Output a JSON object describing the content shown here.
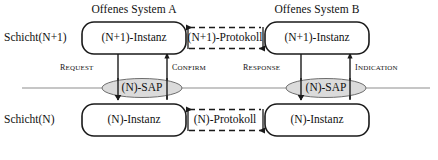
{
  "diagram": {
    "systems": [
      {
        "id": "system-a",
        "title": "Offenes System A"
      },
      {
        "id": "system-b",
        "title": "Offenes System B"
      }
    ],
    "layers": [
      {
        "id": "layer-n-plus-1",
        "label": "Schicht(N+1)"
      },
      {
        "id": "layer-n",
        "label": "Schicht(N)"
      }
    ],
    "entities": [
      {
        "id": "entity-a-n-plus-1",
        "label": "(N+1)-Instanz"
      },
      {
        "id": "entity-b-n-plus-1",
        "label": "(N+1)-Instanz"
      },
      {
        "id": "entity-a-n",
        "label": "(N)-Instanz"
      },
      {
        "id": "entity-b-n",
        "label": "(N)-Instanz"
      }
    ],
    "protocols": [
      {
        "id": "protocol-n-plus-1",
        "label": "(N+1)-Protokoll"
      },
      {
        "id": "protocol-n",
        "label": "(N)-Protokoll"
      }
    ],
    "access_points": [
      {
        "id": "sap-a",
        "label": "(N)-SAP"
      },
      {
        "id": "sap-b",
        "label": "(N)-SAP"
      }
    ],
    "primitives": [
      {
        "id": "primitive-request",
        "label": "Request",
        "direction": "down"
      },
      {
        "id": "primitive-confirm",
        "label": "Confirm",
        "direction": "up"
      },
      {
        "id": "primitive-response",
        "label": "Response",
        "direction": "down"
      },
      {
        "id": "primitive-indication",
        "label": "Indication",
        "direction": "up"
      }
    ],
    "colors": {
      "stroke": "#1a1a1a",
      "sap_fill": "#d9d9d9",
      "boundary_line": "#8a8a8a",
      "background": "#ffffff"
    }
  }
}
